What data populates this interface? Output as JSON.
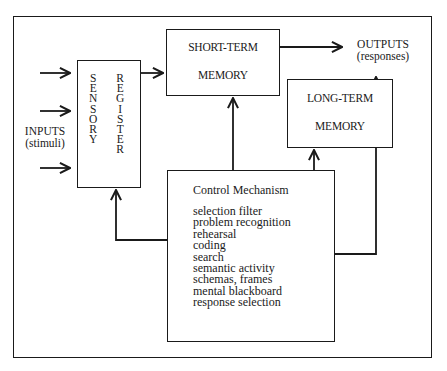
{
  "diagram": {
    "inputs": {
      "line1": "INPUTS",
      "line2": "(stimuli)"
    },
    "outputs": {
      "line1": "OUTPUTS",
      "line2": "(responses)"
    },
    "sensory_register": {
      "col1": [
        "S",
        "E",
        "N",
        "S",
        "O",
        "R",
        "Y"
      ],
      "col2": [
        "R",
        "E",
        "G",
        "I",
        "S",
        "T",
        "E",
        "R"
      ]
    },
    "short_term_memory": {
      "line1": "SHORT-TERM",
      "line2": "MEMORY"
    },
    "long_term_memory": {
      "line1": "LONG-TERM",
      "line2": "MEMORY"
    },
    "control_mechanism": {
      "title": "Control Mechanism",
      "items": [
        "selection filter",
        "problem recognition",
        "rehearsal",
        "coding",
        "search",
        "semantic activity",
        "schemas, frames",
        "mental blackboard",
        "response selection"
      ]
    },
    "colors": {
      "line": "#1a1a1a",
      "background": "#ffffff"
    }
  }
}
